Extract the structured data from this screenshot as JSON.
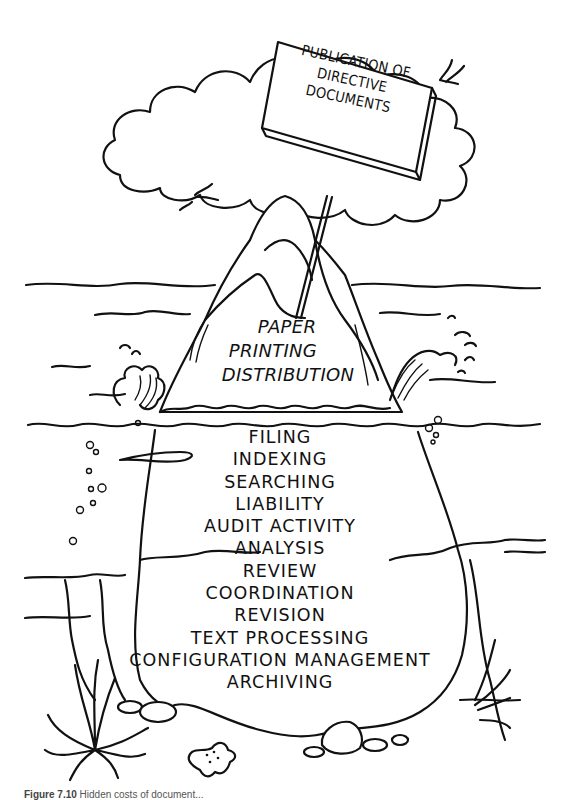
{
  "figure": {
    "sign": {
      "lines": [
        "PUBLICATION OF",
        "DIRECTIVE",
        "DOCUMENTS"
      ]
    },
    "above_water": {
      "lines": [
        "PAPER",
        "PRINTING",
        "DISTRIBUTION"
      ]
    },
    "below_water": {
      "items": [
        "FILING",
        "INDEXING",
        "SEARCHING",
        "LIABILITY",
        "AUDIT ACTIVITY",
        "ANALYSIS",
        "REVIEW",
        "COORDINATION",
        "REVISION",
        "TEXT PROCESSING",
        "CONFIGURATION MANAGEMENT",
        "ARCHIVING"
      ]
    },
    "caption": {
      "label": "Figure 7.10",
      "text": "Hidden costs of document..."
    },
    "decorations": [
      "cloud-icon",
      "bird-icon",
      "wave-splash-icon",
      "seaweed-icon",
      "starfish-icon",
      "rock-icon",
      "bubble-icon"
    ],
    "colors": {
      "ink": "#111111",
      "background": "#ffffff"
    }
  }
}
